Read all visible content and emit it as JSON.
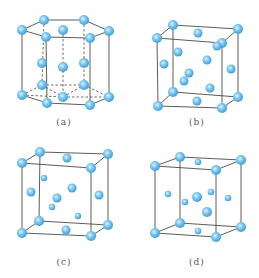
{
  "figure": {
    "colors": {
      "atom": "#5ab6ea",
      "atom_edge": "#3d9fd8",
      "atom_highlight": "#e6f6ff",
      "line": "#4a4a4a"
    },
    "panels": [
      {
        "id": "a",
        "label": "(a)",
        "label_pos": [
          64,
          124
        ],
        "structure": "hexagonal close-packed",
        "edges": [
          [
            22,
            30,
            44,
            20
          ],
          [
            44,
            20,
            84,
            20
          ],
          [
            84,
            20,
            109,
            31
          ],
          [
            109,
            31,
            90,
            38
          ],
          [
            90,
            38,
            46,
            37
          ],
          [
            46,
            37,
            22,
            30
          ],
          [
            22,
            30,
            22,
            95
          ],
          [
            46,
            37,
            47,
            103
          ],
          [
            90,
            38,
            90,
            105
          ],
          [
            109,
            31,
            109,
            97
          ],
          [
            22,
            95,
            47,
            103
          ],
          [
            47,
            103,
            90,
            105
          ],
          [
            90,
            105,
            109,
            97
          ]
        ],
        "dashed": [
          [
            44,
            20,
            42,
            85
          ],
          [
            84,
            20,
            84,
            85
          ],
          [
            22,
            95,
            42,
            85
          ],
          [
            42,
            85,
            84,
            85
          ],
          [
            84,
            85,
            109,
            97
          ],
          [
            42,
            85,
            63,
            97
          ],
          [
            63,
            97,
            84,
            85
          ],
          [
            22,
            95,
            63,
            97
          ],
          [
            63,
            97,
            109,
            97
          ],
          [
            63,
            30,
            63,
            97
          ]
        ],
        "atoms": [
          [
            44,
            20,
            5
          ],
          [
            84,
            20,
            5
          ],
          [
            22,
            30,
            5
          ],
          [
            63,
            30,
            5
          ],
          [
            109,
            31,
            5
          ],
          [
            46,
            37,
            5
          ],
          [
            90,
            38,
            5
          ],
          [
            42,
            63,
            5
          ],
          [
            63,
            67,
            5
          ],
          [
            84,
            63,
            5
          ],
          [
            42,
            85,
            5
          ],
          [
            84,
            85,
            5
          ],
          [
            22,
            95,
            5
          ],
          [
            63,
            97,
            5
          ],
          [
            109,
            97,
            5
          ],
          [
            47,
            103,
            5
          ],
          [
            90,
            105,
            5
          ]
        ]
      },
      {
        "id": "b",
        "label": "(b)",
        "label_pos": [
          197,
          124
        ],
        "structure": "cubic",
        "edges": [
          [
            173,
            25,
            238,
            29
          ],
          [
            157,
            38,
            222,
            43
          ],
          [
            173,
            25,
            157,
            38
          ],
          [
            238,
            29,
            222,
            43
          ],
          [
            157,
            38,
            158,
            106
          ],
          [
            222,
            43,
            222,
            108
          ],
          [
            238,
            29,
            238,
            97
          ],
          [
            173,
            25,
            173,
            92
          ],
          [
            158,
            106,
            222,
            108
          ],
          [
            173,
            92,
            238,
            97
          ],
          [
            158,
            106,
            173,
            92
          ],
          [
            222,
            108,
            238,
            97
          ]
        ],
        "dashed": [],
        "atoms": [
          [
            173,
            25,
            5
          ],
          [
            238,
            29,
            5
          ],
          [
            157,
            38,
            5
          ],
          [
            222,
            43,
            5
          ],
          [
            173,
            92,
            5
          ],
          [
            238,
            97,
            5
          ],
          [
            158,
            106,
            5
          ],
          [
            222,
            108,
            5
          ],
          [
            198,
            33,
            4.5
          ],
          [
            217,
            46,
            4.5
          ],
          [
            178,
            52,
            4.5
          ],
          [
            164,
            64,
            4.5
          ],
          [
            207,
            60,
            4.5
          ],
          [
            231,
            69,
            4.5
          ],
          [
            189,
            73,
            4.5
          ],
          [
            184,
            81,
            4.5
          ],
          [
            210,
            88,
            4.5
          ],
          [
            197,
            101,
            4.5
          ]
        ]
      },
      {
        "id": "c",
        "label": "(c)",
        "label_pos": [
          64,
          264
        ],
        "structure": "cubic",
        "edges": [
          [
            40,
            152,
            108,
            154
          ],
          [
            22,
            163,
            91,
            168
          ],
          [
            40,
            152,
            22,
            163
          ],
          [
            108,
            154,
            91,
            168
          ],
          [
            22,
            163,
            22,
            233
          ],
          [
            91,
            168,
            91,
            236
          ],
          [
            108,
            154,
            108,
            225
          ],
          [
            40,
            152,
            39,
            221
          ],
          [
            22,
            233,
            91,
            236
          ],
          [
            39,
            221,
            108,
            225
          ],
          [
            22,
            233,
            39,
            221
          ],
          [
            91,
            236,
            108,
            225
          ]
        ],
        "dashed": [],
        "atoms": [
          [
            40,
            152,
            5
          ],
          [
            108,
            154,
            5
          ],
          [
            22,
            163,
            5
          ],
          [
            91,
            168,
            5
          ],
          [
            39,
            221,
            5
          ],
          [
            108,
            225,
            5
          ],
          [
            22,
            233,
            5
          ],
          [
            91,
            236,
            5
          ],
          [
            67,
            158,
            4.5
          ],
          [
            44,
            178,
            3.2
          ],
          [
            31,
            192,
            4.5
          ],
          [
            72,
            188,
            4.5
          ],
          [
            99,
            195,
            4.5
          ],
          [
            57,
            198,
            4.5
          ],
          [
            52,
            207,
            3.2
          ],
          [
            78,
            216,
            3.2
          ],
          [
            66,
            230,
            4.5
          ]
        ]
      },
      {
        "id": "d",
        "label": "(d)",
        "label_pos": [
          197,
          264
        ],
        "structure": "cubic",
        "edges": [
          [
            180,
            157,
            241,
            160
          ],
          [
            155,
            166,
            216,
            170
          ],
          [
            180,
            157,
            155,
            166
          ],
          [
            241,
            160,
            216,
            170
          ],
          [
            155,
            166,
            155,
            233
          ],
          [
            216,
            170,
            216,
            237
          ],
          [
            241,
            160,
            241,
            227
          ],
          [
            180,
            157,
            180,
            223
          ],
          [
            155,
            233,
            216,
            237
          ],
          [
            180,
            223,
            241,
            227
          ],
          [
            155,
            233,
            180,
            223
          ],
          [
            216,
            237,
            241,
            227
          ]
        ],
        "dashed": [],
        "atoms": [
          [
            180,
            157,
            5
          ],
          [
            241,
            160,
            5
          ],
          [
            155,
            166,
            5
          ],
          [
            216,
            170,
            5
          ],
          [
            180,
            223,
            5
          ],
          [
            241,
            227,
            5
          ],
          [
            155,
            233,
            5
          ],
          [
            216,
            237,
            5
          ],
          [
            198,
            162,
            3.3
          ],
          [
            168,
            194,
            3.3
          ],
          [
            197,
            197,
            5
          ],
          [
            211,
            192,
            3.3
          ],
          [
            228,
            198,
            3.3
          ],
          [
            185,
            202,
            3.3
          ],
          [
            207,
            212,
            5
          ],
          [
            198,
            231,
            3.3
          ]
        ]
      }
    ]
  }
}
